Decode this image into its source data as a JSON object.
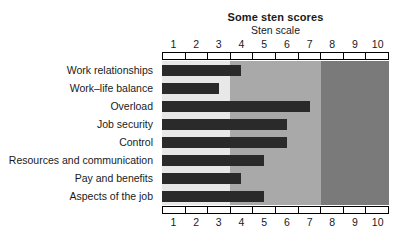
{
  "chart_data": {
    "type": "bar",
    "orientation": "horizontal",
    "title": "Some sten scores",
    "xlabel": "Sten scale",
    "ylabel": "",
    "xlim": [
      0.5,
      10.5
    ],
    "xticks": [
      "1",
      "2",
      "3",
      "4",
      "5",
      "6",
      "7",
      "8",
      "9",
      "10"
    ],
    "grid": false,
    "legend": null,
    "categories": [
      "Work relationships",
      "Work–life balance",
      "Overload",
      "Job security",
      "Control",
      "Resources and communication",
      "Pay and benefits",
      "Aspects of the job"
    ],
    "values": [
      4,
      3,
      7,
      6,
      6,
      5,
      4,
      5
    ],
    "bands": [
      {
        "name": "low-band",
        "from": 0.5,
        "to": 3.5,
        "color": "#e8e8e8"
      },
      {
        "name": "mid-band",
        "from": 3.5,
        "to": 7.5,
        "color": "#a9a9a9"
      },
      {
        "name": "high-band",
        "from": 7.5,
        "to": 10.5,
        "color": "#7a7a7a"
      }
    ],
    "bar_color": "#2a2a2a",
    "axis_color": "#000000",
    "background": "#ffffff"
  }
}
